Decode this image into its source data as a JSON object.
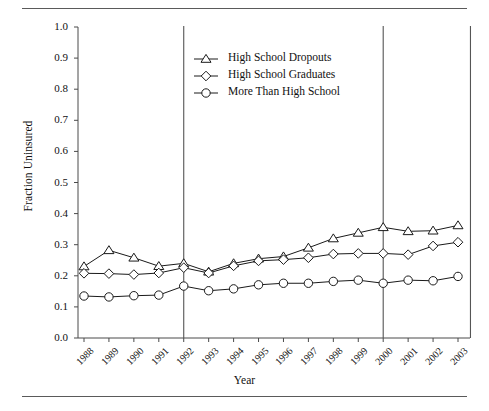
{
  "figure": {
    "has_top_rule": true,
    "has_bottom_rule": true,
    "rule_color": "#5a5a5a"
  },
  "chart_data": {
    "type": "line",
    "title": "",
    "xlabel": "Year",
    "ylabel": "Fraction Uninsured",
    "x": [
      1988,
      1989,
      1990,
      1991,
      1992,
      1993,
      1994,
      1995,
      1996,
      1997,
      1998,
      1999,
      2000,
      2001,
      2002,
      2003
    ],
    "categories": [
      "1988",
      "1989",
      "1990",
      "1991",
      "1992",
      "1993",
      "1994",
      "1995",
      "1996",
      "1997",
      "1998",
      "1999",
      "2000",
      "2001",
      "2002",
      "2003"
    ],
    "ylim": [
      0.0,
      1.0
    ],
    "yticks": [
      0.0,
      0.1,
      0.2,
      0.3,
      0.4,
      0.5,
      0.6,
      0.7,
      0.8,
      0.9,
      1.0
    ],
    "ytick_labels": [
      "0.0",
      "0.1",
      "0.2",
      "0.3",
      "0.4",
      "0.5",
      "0.6",
      "0.7",
      "0.8",
      "0.9",
      "1.0"
    ],
    "grid": false,
    "legend_position": "upper center",
    "series": [
      {
        "name": "High  School Dropouts",
        "marker": "triangle",
        "color": "#1a1a1a",
        "values": [
          0.23,
          0.282,
          0.258,
          0.231,
          0.24,
          0.213,
          0.24,
          0.255,
          0.262,
          0.29,
          0.32,
          0.338,
          0.356,
          0.343,
          0.345,
          0.362
        ]
      },
      {
        "name": "High School Graduates",
        "marker": "diamond",
        "color": "#1a1a1a",
        "values": [
          0.208,
          0.207,
          0.204,
          0.209,
          0.226,
          0.209,
          0.232,
          0.248,
          0.252,
          0.258,
          0.27,
          0.272,
          0.272,
          0.268,
          0.296,
          0.308
        ]
      },
      {
        "name": "More Than High School",
        "marker": "circle",
        "color": "#1a1a1a",
        "values": [
          0.135,
          0.132,
          0.136,
          0.138,
          0.167,
          0.152,
          0.158,
          0.171,
          0.176,
          0.176,
          0.182,
          0.186,
          0.176,
          0.186,
          0.184,
          0.198
        ]
      }
    ],
    "vertical_reference_lines": [
      {
        "label": "1992",
        "x": 1992
      },
      {
        "label": "2000",
        "x": 2000
      },
      {
        "label": "2003-edge",
        "x": 2003.5
      }
    ],
    "annotations": []
  },
  "legend": {
    "items": [
      {
        "label": "High  School Dropouts",
        "marker": "triangle-up-icon"
      },
      {
        "label": "High School Graduates",
        "marker": "diamond-icon"
      },
      {
        "label": "More Than High School",
        "marker": "circle-icon"
      }
    ]
  }
}
